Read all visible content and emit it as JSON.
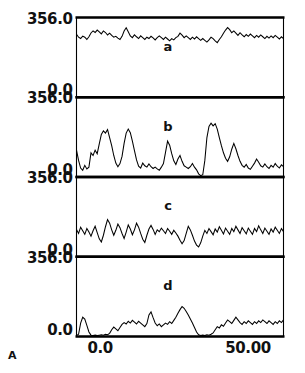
{
  "figure": {
    "label": "A",
    "background": "#ffffff",
    "ink": "#000000"
  },
  "axes": {
    "x_ticks": [
      {
        "label": "0.0",
        "value": 0.0
      },
      {
        "label": "50.00",
        "value": 50.0
      }
    ],
    "y_ticks": [
      {
        "label": "356.0",
        "value": 356.0
      },
      {
        "label": "0.0",
        "value": 0.0
      }
    ],
    "xlim": [
      -8.0,
      62.0
    ],
    "ylim": [
      0.0,
      356.0
    ]
  },
  "chart_data": {
    "type": "line",
    "title": "",
    "subtitle": "",
    "xlabel": "",
    "ylabel": "",
    "xlim": [
      -8.0,
      62.0
    ],
    "ylim": [
      0,
      356
    ],
    "grid": false,
    "legend": "none",
    "layout": "4 stacked panels sharing one x-axis",
    "xtick_labels": [
      "0.0",
      "50.00"
    ],
    "xtick_values": [
      0.0,
      50.0
    ],
    "ytick_labels": [
      "356.0",
      "0.0"
    ],
    "ytick_values": [
      356.0,
      0.0
    ],
    "panels": [
      {
        "name": "a",
        "label": "a",
        "description": "dense high-frequency low-amplitude noise riding near the top of the panel",
        "ylim": [
          0,
          356
        ],
        "x": [
          -8.0,
          -7.3,
          -6.6,
          -5.9,
          -5.2,
          -4.5,
          -3.8,
          -3.1,
          -2.4,
          -1.7,
          -1.0,
          -0.3,
          0.4,
          1.1,
          1.8,
          2.5,
          3.2,
          3.9,
          4.6,
          5.3,
          6.0,
          6.7,
          7.4,
          8.1,
          8.8,
          9.5,
          10.2,
          10.9,
          11.6,
          12.3,
          13.0,
          13.7,
          14.4,
          15.1,
          15.8,
          16.5,
          17.2,
          17.9,
          18.6,
          19.3,
          20.0,
          20.7,
          21.4,
          22.1,
          22.8,
          23.5,
          24.2,
          24.9,
          25.6,
          26.3,
          27.0,
          27.7,
          28.4,
          29.1,
          29.8,
          30.5,
          31.2,
          31.9,
          32.6,
          33.3,
          34.0,
          34.7,
          35.4,
          36.1,
          36.8,
          37.5,
          38.2,
          38.9,
          39.6,
          40.3,
          41.0,
          41.7,
          42.4,
          43.1,
          43.8,
          44.5,
          45.2,
          45.9,
          46.6,
          47.3,
          48.0,
          48.7,
          49.4,
          50.1,
          50.8,
          51.5,
          52.2,
          52.9,
          53.6,
          54.3,
          55.0,
          55.7,
          56.4,
          57.1,
          57.8,
          58.5,
          59.2,
          59.9,
          60.6,
          61.3,
          62.0
        ],
        "values": [
          281,
          268,
          262,
          273,
          268,
          258,
          270,
          287,
          296,
          289,
          300,
          292,
          283,
          296,
          289,
          278,
          286,
          276,
          268,
          272,
          264,
          258,
          272,
          296,
          310,
          292,
          274,
          266,
          279,
          270,
          262,
          274,
          266,
          258,
          268,
          262,
          272,
          265,
          256,
          266,
          274,
          266,
          258,
          268,
          260,
          252,
          262,
          256,
          266,
          272,
          286,
          277,
          266,
          274,
          266,
          258,
          268,
          260,
          270,
          262,
          254,
          262,
          254,
          246,
          256,
          268,
          262,
          252,
          244,
          258,
          270,
          286,
          300,
          311,
          302,
          288,
          296,
          286,
          276,
          288,
          278,
          270,
          280,
          272,
          282,
          274,
          266,
          276,
          268,
          278,
          270,
          262,
          272,
          264,
          274,
          266,
          276,
          268,
          260,
          270,
          262
        ]
      },
      {
        "name": "b",
        "label": "b",
        "description": "sharp isolated spikes rising from a near-zero baseline; tallest double-topped peak in the right half",
        "ylim": [
          0,
          356
        ],
        "x": [
          -8.0,
          -7.3,
          -6.6,
          -5.9,
          -5.2,
          -4.5,
          -3.8,
          -3.1,
          -2.4,
          -1.7,
          -1.0,
          -0.3,
          0.4,
          1.1,
          1.8,
          2.5,
          3.2,
          3.9,
          4.6,
          5.3,
          6.0,
          6.7,
          7.4,
          8.1,
          8.8,
          9.5,
          10.2,
          10.9,
          11.6,
          12.3,
          13.0,
          13.7,
          14.4,
          15.1,
          15.8,
          16.5,
          17.2,
          17.9,
          18.6,
          19.3,
          20.0,
          20.7,
          21.4,
          22.1,
          22.8,
          23.5,
          24.2,
          24.9,
          25.6,
          26.3,
          27.0,
          27.7,
          28.4,
          29.1,
          29.8,
          30.5,
          31.2,
          31.9,
          32.6,
          33.3,
          34.0,
          34.7,
          35.4,
          36.1,
          36.8,
          37.5,
          38.2,
          38.9,
          39.6,
          40.3,
          41.0,
          41.7,
          42.4,
          43.1,
          43.8,
          44.5,
          45.2,
          45.9,
          46.6,
          47.3,
          48.0,
          48.7,
          49.4,
          50.1,
          50.8,
          51.5,
          52.2,
          52.9,
          53.6,
          54.3,
          55.0,
          55.7,
          56.4,
          57.1,
          57.8,
          58.5,
          59.2,
          59.9,
          60.6,
          61.3,
          62.0
        ],
        "values": [
          120,
          74,
          40,
          30,
          52,
          36,
          44,
          108,
          96,
          120,
          104,
          148,
          190,
          206,
          196,
          212,
          176,
          140,
          96,
          62,
          46,
          60,
          92,
          150,
          196,
          214,
          198,
          160,
          118,
          76,
          48,
          40,
          62,
          50,
          44,
          58,
          46,
          38,
          44,
          36,
          30,
          44,
          60,
          110,
          160,
          142,
          104,
          72,
          56,
          80,
          96,
          70,
          50,
          44,
          38,
          46,
          60,
          44,
          32,
          14,
          6,
          10,
          74,
          176,
          226,
          240,
          228,
          238,
          214,
          176,
          140,
          108,
          84,
          70,
          90,
          124,
          150,
          126,
          96,
          70,
          52,
          44,
          56,
          40,
          34,
          48,
          62,
          80,
          66,
          50,
          44,
          58,
          46,
          38,
          52,
          44,
          60,
          48,
          40,
          54,
          46
        ]
      },
      {
        "name": "c",
        "label": "c",
        "description": "continuous mid-amplitude oscillation with roughly regular periodicity, centred low in the panel",
        "ylim": [
          0,
          356
        ],
        "x": [
          -8.0,
          -7.3,
          -6.6,
          -5.9,
          -5.2,
          -4.5,
          -3.8,
          -3.1,
          -2.4,
          -1.7,
          -1.0,
          -0.3,
          0.4,
          1.1,
          1.8,
          2.5,
          3.2,
          3.9,
          4.6,
          5.3,
          6.0,
          6.7,
          7.4,
          8.1,
          8.8,
          9.5,
          10.2,
          10.9,
          11.6,
          12.3,
          13.0,
          13.7,
          14.4,
          15.1,
          15.8,
          16.5,
          17.2,
          17.9,
          18.6,
          19.3,
          20.0,
          20.7,
          21.4,
          22.1,
          22.8,
          23.5,
          24.2,
          24.9,
          25.6,
          26.3,
          27.0,
          27.7,
          28.4,
          29.1,
          29.8,
          30.5,
          31.2,
          31.9,
          32.6,
          33.3,
          34.0,
          34.7,
          35.4,
          36.1,
          36.8,
          37.5,
          38.2,
          38.9,
          39.6,
          40.3,
          41.0,
          41.7,
          42.4,
          43.1,
          43.8,
          44.5,
          45.2,
          45.9,
          46.6,
          47.3,
          48.0,
          48.7,
          49.4,
          50.1,
          50.8,
          51.5,
          52.2,
          52.9,
          53.6,
          54.3,
          55.0,
          55.7,
          56.4,
          57.1,
          57.8,
          58.5,
          59.2,
          59.9,
          60.6,
          61.3,
          62.0
        ],
        "values": [
          122,
          104,
          132,
          116,
          100,
          126,
          110,
          92,
          116,
          136,
          108,
          80,
          66,
          96,
          134,
          166,
          150,
          120,
          96,
          118,
          146,
          130,
          104,
          82,
          110,
          142,
          124,
          98,
          120,
          150,
          132,
          104,
          78,
          64,
          96,
          124,
          140,
          122,
          100,
          120,
          112,
          128,
          116,
          104,
          126,
          114,
          100,
          118,
          106,
          92,
          74,
          58,
          72,
          104,
          136,
          120,
          96,
          70,
          52,
          44,
          62,
          92,
          118,
          104,
          126,
          112,
          98,
          124,
          110,
          134,
          118,
          102,
          128,
          114,
          100,
          126,
          112,
          136,
          120,
          104,
          130,
          116,
          102,
          128,
          114,
          100,
          126,
          112,
          138,
          120,
          104,
          128,
          114,
          100,
          124,
          110,
          132,
          118,
          104,
          126,
          112
        ]
      },
      {
        "name": "d",
        "label": "d",
        "description": "mostly flat at baseline; one narrow early spike, a broad low mound in the middle, and low ripples at the right",
        "ylim": [
          0,
          356
        ],
        "x": [
          -8.0,
          -7.3,
          -6.6,
          -5.9,
          -5.2,
          -4.5,
          -3.8,
          -3.1,
          -2.4,
          -1.7,
          -1.0,
          -0.3,
          0.4,
          1.1,
          1.8,
          2.5,
          3.2,
          3.9,
          4.6,
          5.3,
          6.0,
          6.7,
          7.4,
          8.1,
          8.8,
          9.5,
          10.2,
          10.9,
          11.6,
          12.3,
          13.0,
          13.7,
          14.4,
          15.1,
          15.8,
          16.5,
          17.2,
          17.9,
          18.6,
          19.3,
          20.0,
          20.7,
          21.4,
          22.1,
          22.8,
          23.5,
          24.2,
          24.9,
          25.6,
          26.3,
          27.0,
          27.7,
          28.4,
          29.1,
          29.8,
          30.5,
          31.2,
          31.9,
          32.6,
          33.3,
          34.0,
          34.7,
          35.4,
          36.1,
          36.8,
          37.5,
          38.2,
          38.9,
          39.6,
          40.3,
          41.0,
          41.7,
          42.4,
          43.1,
          43.8,
          44.5,
          45.2,
          45.9,
          46.6,
          47.3,
          48.0,
          48.7,
          49.4,
          50.1,
          50.8,
          51.5,
          52.2,
          52.9,
          53.6,
          54.3,
          55.0,
          55.7,
          56.4,
          57.1,
          57.8,
          58.5,
          59.2,
          59.9,
          60.6,
          61.3,
          62.0
        ],
        "values": [
          4,
          10,
          60,
          86,
          78,
          50,
          20,
          6,
          4,
          6,
          4,
          6,
          8,
          6,
          10,
          8,
          14,
          30,
          42,
          34,
          26,
          40,
          54,
          62,
          56,
          68,
          60,
          72,
          64,
          56,
          68,
          60,
          52,
          44,
          58,
          96,
          110,
          84,
          60,
          48,
          56,
          44,
          52,
          60,
          54,
          66,
          58,
          72,
          86,
          104,
          120,
          134,
          126,
          112,
          96,
          78,
          60,
          40,
          20,
          8,
          4,
          6,
          4,
          8,
          6,
          10,
          16,
          30,
          44,
          38,
          52,
          46,
          60,
          74,
          66,
          58,
          72,
          86,
          74,
          62,
          54,
          66,
          58,
          70,
          62,
          54,
          66,
          58,
          70,
          62,
          74,
          66,
          58,
          70,
          62,
          54,
          66,
          58,
          70,
          62,
          74
        ]
      }
    ]
  }
}
